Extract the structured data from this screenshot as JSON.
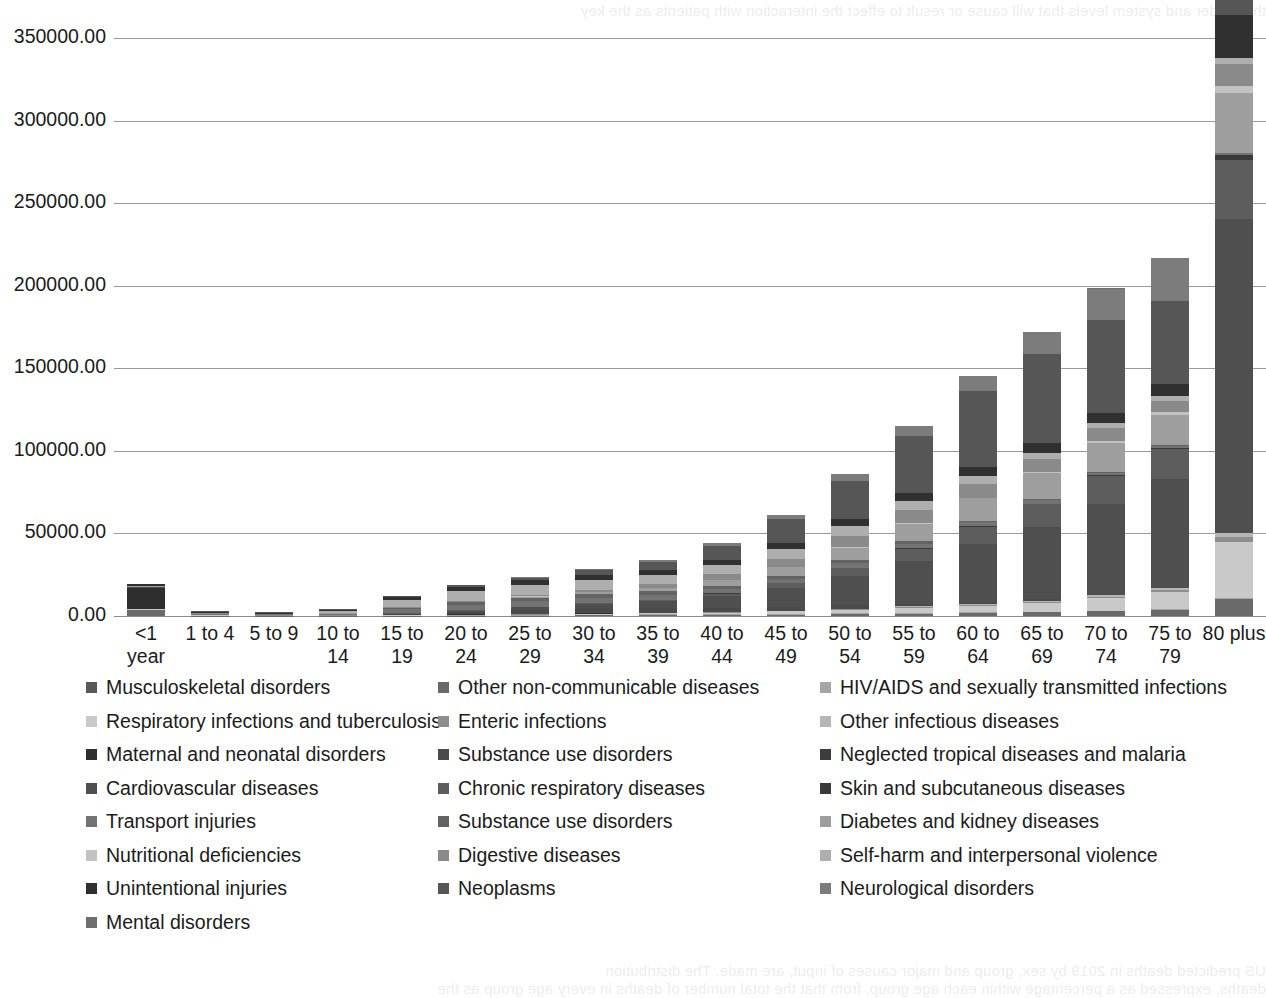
{
  "page": {
    "bleed_top": "the reader and system levels that will cause or result to effect the interaction with patients as the key",
    "bleed_bottom_1": "US predicted deaths in 2019 by sex, group and major causes of input, are made. The distribution",
    "bleed_bottom_2": "deaths, expressed as a percentage within each age group, from that the total number of deaths in every age group as the"
  },
  "chart_data": {
    "type": "bar",
    "subtype": "stacked-bar",
    "title": "",
    "xlabel": "",
    "ylabel": "",
    "ylim": [
      0,
      350000
    ],
    "ytick_interval": 50000,
    "grid": true,
    "legend_position": "bottom",
    "ytick_labels": [
      "350000.00",
      "300000.00",
      "250000.00",
      "200000.00",
      "150000.00",
      "100000.00",
      "50000.00",
      "0.00"
    ],
    "ytick_values": [
      350000,
      300000,
      250000,
      200000,
      150000,
      100000,
      50000,
      0
    ],
    "categories": [
      "<1 year",
      "1 to 4",
      "5 to 9",
      "10 to 14",
      "15 to 19",
      "20 to 24",
      "25 to 29",
      "30 to 34",
      "35 to 39",
      "40 to 44",
      "45 to 49",
      "50 to 54",
      "55 to 59",
      "60 to 64",
      "65 to 69",
      "70 to 74",
      "75 to 79",
      "80 plus"
    ],
    "series": [
      {
        "name": "Musculoskeletal disorders",
        "color": "#585858",
        "values": [
          0,
          0,
          0,
          0,
          0,
          0,
          0,
          0,
          0,
          0,
          0,
          0,
          0,
          0,
          0,
          0,
          0,
          0
        ]
      },
      {
        "name": "Other non-communicable diseases",
        "color": "#6a6a6a",
        "values": [
          3800,
          300,
          200,
          200,
          200,
          300,
          300,
          400,
          500,
          600,
          800,
          1100,
          1400,
          1800,
          2300,
          3000,
          3800,
          10500
        ]
      },
      {
        "name": "HIV/AIDS and sexually transmitted infections",
        "color": "#a5a5a5",
        "values": [
          0,
          0,
          0,
          0,
          100,
          200,
          300,
          400,
          500,
          600,
          700,
          700,
          600,
          400,
          300,
          200,
          200,
          200
        ]
      },
      {
        "name": "Respiratory infections and tuberculosis",
        "color": "#c9c9c9",
        "values": [
          300,
          100,
          100,
          100,
          100,
          200,
          300,
          400,
          600,
          900,
          1300,
          2000,
          2900,
          4000,
          5400,
          7600,
          10500,
          34000
        ]
      },
      {
        "name": "Enteric infections",
        "color": "#8e8e8e",
        "values": [
          100,
          50,
          50,
          50,
          50,
          50,
          100,
          100,
          100,
          200,
          200,
          300,
          400,
          500,
          700,
          900,
          1200,
          3000
        ]
      },
      {
        "name": "Other infectious diseases",
        "color": "#b6b6b6",
        "values": [
          100,
          50,
          50,
          50,
          50,
          100,
          100,
          100,
          200,
          200,
          300,
          400,
          500,
          600,
          700,
          900,
          1100,
          2500
        ]
      },
      {
        "name": "Maternal and neonatal disorders",
        "color": "#2e2e2e",
        "values": [
          12500,
          100,
          0,
          0,
          100,
          200,
          200,
          200,
          100,
          100,
          50,
          0,
          0,
          0,
          0,
          0,
          0,
          0
        ]
      },
      {
        "name": "Substance use disorders",
        "color": "#4a4a4a",
        "values": [
          0,
          0,
          0,
          100,
          500,
          1500,
          2600,
          3000,
          2800,
          2400,
          2100,
          1900,
          1600,
          1200,
          700,
          400,
          200,
          200
        ]
      },
      {
        "name": "Neglected tropical diseases and malaria",
        "color": "#3c3c3c",
        "values": [
          0,
          0,
          0,
          0,
          0,
          0,
          0,
          0,
          0,
          0,
          0,
          0,
          0,
          0,
          0,
          0,
          0,
          0
        ]
      },
      {
        "name": "Cardiovascular diseases",
        "color": "#4f4f4f",
        "values": [
          600,
          200,
          150,
          200,
          400,
          800,
          1500,
          2600,
          4200,
          7000,
          11500,
          18000,
          26000,
          35000,
          44000,
          55000,
          66000,
          190000
        ]
      },
      {
        "name": "Chronic respiratory diseases",
        "color": "#5d5d5d",
        "values": [
          100,
          100,
          100,
          100,
          150,
          200,
          300,
          500,
          900,
          1600,
          2800,
          4800,
          7500,
          10500,
          13500,
          16500,
          18000,
          36000
        ]
      },
      {
        "name": "Skin and subcutaneous diseases",
        "color": "#3a3a3a",
        "values": [
          0,
          0,
          0,
          0,
          0,
          0,
          50,
          50,
          100,
          100,
          150,
          200,
          300,
          400,
          500,
          700,
          900,
          2600
        ]
      },
      {
        "name": "Transport injuries",
        "color": "#737373",
        "values": [
          300,
          500,
          400,
          600,
          2800,
          3400,
          3200,
          3000,
          2800,
          2700,
          2700,
          2800,
          2700,
          2400,
          2000,
          1600,
          1300,
          1500
        ]
      },
      {
        "name": "Substance use disorders",
        "color": "#636363",
        "values": [
          0,
          0,
          0,
          100,
          400,
          1300,
          2200,
          2600,
          2400,
          2100,
          1900,
          1700,
          1400,
          1000,
          600,
          300,
          200,
          200
        ]
      },
      {
        "name": "Diabetes and kidney diseases",
        "color": "#9e9e9e",
        "values": [
          200,
          100,
          100,
          100,
          200,
          400,
          700,
          1200,
          2000,
          3200,
          5000,
          7600,
          10500,
          13500,
          16000,
          18000,
          18500,
          36000
        ]
      },
      {
        "name": "Nutritional deficiencies",
        "color": "#c2c2c2",
        "values": [
          100,
          50,
          50,
          50,
          50,
          50,
          50,
          100,
          100,
          150,
          200,
          300,
          400,
          500,
          700,
          1000,
          1400,
          4500
        ]
      },
      {
        "name": "Digestive diseases",
        "color": "#8a8a8a",
        "values": [
          200,
          100,
          100,
          100,
          200,
          300,
          600,
          1200,
          2200,
          3600,
          5200,
          6800,
          7800,
          8200,
          8000,
          7600,
          7000,
          13000
        ]
      },
      {
        "name": "Self-harm and interpersonal violence",
        "color": "#aeaeae",
        "values": [
          100,
          200,
          200,
          1200,
          4500,
          6200,
          6400,
          6000,
          5500,
          5400,
          5600,
          5800,
          5600,
          4600,
          3600,
          3000,
          2800,
          3600
        ]
      },
      {
        "name": "Unintentional injuries",
        "color": "#303030",
        "values": [
          900,
          700,
          500,
          700,
          1600,
          2400,
          2800,
          3000,
          3000,
          3200,
          3600,
          4400,
          5200,
          5600,
          5800,
          6400,
          7600,
          26000
        ]
      },
      {
        "name": "Neoplasms",
        "color": "#565656",
        "values": [
          100,
          400,
          500,
          500,
          700,
          1000,
          1600,
          2800,
          5000,
          8600,
          14500,
          23000,
          34000,
          46000,
          54000,
          56000,
          50000,
          72000
        ]
      },
      {
        "name": "Neurological disorders",
        "color": "#7c7c7c",
        "values": [
          200,
          100,
          100,
          100,
          100,
          200,
          300,
          500,
          800,
          1400,
          2400,
          4000,
          6200,
          9000,
          13000,
          19000,
          26000,
          78000
        ]
      },
      {
        "name": "Mental disorders",
        "color": "#6f6f6f",
        "values": [
          0,
          0,
          0,
          0,
          50,
          100,
          100,
          200,
          200,
          300,
          300,
          400,
          400,
          400,
          400,
          400,
          400,
          900
        ]
      }
    ],
    "totals": [
      3800,
      1500,
      1000,
      1200,
      1600,
      2300,
      3200,
      4200,
      5500,
      7000,
      9800,
      16500,
      23500,
      31500,
      43000,
      68000,
      80000,
      340000
    ]
  },
  "legend": {
    "rows": [
      [
        {
          "label": "Musculoskeletal disorders",
          "color": "#585858"
        },
        {
          "label": "Other non-communicable diseases",
          "color": "#6a6a6a"
        },
        {
          "label": "HIV/AIDS and sexually transmitted infections",
          "color": "#a5a5a5"
        }
      ],
      [
        {
          "label": "Respiratory infections and tuberculosis",
          "color": "#c9c9c9"
        },
        {
          "label": "Enteric infections",
          "color": "#8e8e8e"
        },
        {
          "label": "Other infectious diseases",
          "color": "#b6b6b6"
        }
      ],
      [
        {
          "label": "Maternal and neonatal disorders",
          "color": "#2e2e2e"
        },
        {
          "label": "Substance use disorders",
          "color": "#4a4a4a"
        },
        {
          "label": "Neglected tropical diseases and malaria",
          "color": "#3c3c3c"
        }
      ],
      [
        {
          "label": "Cardiovascular diseases",
          "color": "#4f4f4f"
        },
        {
          "label": "Chronic respiratory diseases",
          "color": "#5d5d5d"
        },
        {
          "label": "Skin and subcutaneous diseases",
          "color": "#3a3a3a"
        }
      ],
      [
        {
          "label": "Transport injuries",
          "color": "#737373"
        },
        {
          "label": "Substance use disorders",
          "color": "#636363"
        },
        {
          "label": "Diabetes and kidney diseases",
          "color": "#9e9e9e"
        }
      ],
      [
        {
          "label": "Nutritional deficiencies",
          "color": "#c2c2c2"
        },
        {
          "label": "Digestive diseases",
          "color": "#8a8a8a"
        },
        {
          "label": "Self-harm and interpersonal violence",
          "color": "#aeaeae"
        }
      ],
      [
        {
          "label": "Unintentional injuries",
          "color": "#303030"
        },
        {
          "label": "Neoplasms",
          "color": "#565656"
        },
        {
          "label": "Neurological disorders",
          "color": "#7c7c7c"
        }
      ],
      [
        {
          "label": "Mental disorders",
          "color": "#6f6f6f"
        }
      ]
    ]
  }
}
